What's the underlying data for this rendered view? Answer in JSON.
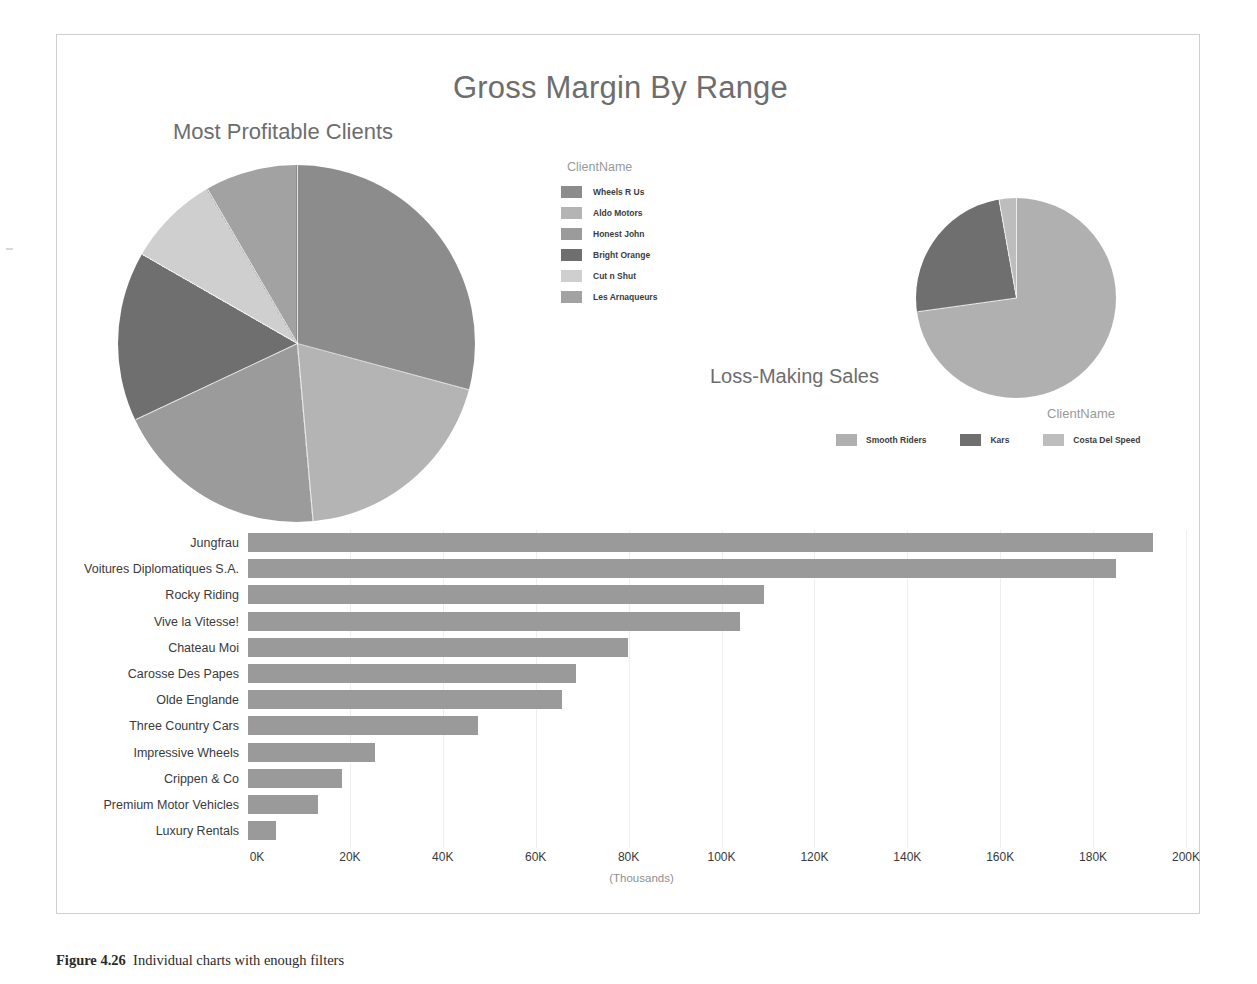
{
  "report": {
    "title": "Gross Margin By Range",
    "caption_number": "Figure 4.26",
    "caption_text": "Individual charts with enough filters"
  },
  "pie1": {
    "title": "Most Profitable Clients",
    "legend_title": "ClientName"
  },
  "pie2": {
    "title": "Loss-Making Sales",
    "legend_title": "ClientName"
  },
  "bar": {
    "axis_units": "(Thousands)"
  },
  "colors": {
    "slice_1": "#8c8c8c",
    "slice_2": "#b4b4b4",
    "slice_3": "#9b9b9b",
    "slice_4": "#6f6f6f",
    "slice_5": "#cfcfcf",
    "slice_6": "#a2a2a2",
    "bar_fill": "#9a9a9a",
    "title_text": "#6d6d6d",
    "legend_title_text": "#9a9a9a",
    "gridline": "#eeeeee",
    "frame_border": "#cfcfcf"
  },
  "chart_data": [
    {
      "type": "pie",
      "title": "Most Profitable Clients",
      "legend_title": "ClientName",
      "legend_position": "right",
      "labels": [
        "Wheels R Us",
        "Aldo Motors",
        "Honest John",
        "Bright Orange",
        "Cut n Shut",
        "Les Arnaqueurs"
      ],
      "percentages": [
        29.2,
        19.4,
        19.4,
        15.3,
        8.3,
        8.4
      ],
      "colors": [
        "#8c8c8c",
        "#b4b4b4",
        "#9b9b9b",
        "#6f6f6f",
        "#cfcfcf",
        "#a2a2a2"
      ]
    },
    {
      "type": "pie",
      "title": "Loss-Making Sales",
      "legend_title": "ClientName",
      "legend_position": "bottom",
      "labels": [
        "Smooth Riders",
        "Kars",
        "Costa Del Speed"
      ],
      "percentages": [
        72.8,
        24.4,
        2.8
      ],
      "colors": [
        "#b0b0b0",
        "#6f6f6f",
        "#bdbdbd"
      ]
    },
    {
      "type": "bar",
      "orientation": "horizontal",
      "title": "",
      "xlabel": "(Thousands)",
      "ylabel": "",
      "xlim": [
        0,
        200
      ],
      "xticks": [
        0,
        20,
        40,
        60,
        80,
        100,
        120,
        140,
        160,
        180,
        200
      ],
      "xtick_labels": [
        "0K",
        "20K",
        "40K",
        "60K",
        "80K",
        "100K",
        "120K",
        "140K",
        "160K",
        "180K",
        "200K"
      ],
      "grid": true,
      "categories": [
        "Jungfrau",
        "Voitures Diplomatiques S.A.",
        "Rocky Riding",
        "Vive la Vitesse!",
        "Chateau Moi",
        "Carosse Des Papes",
        "Olde Englande",
        "Three Country Cars",
        "Impressive Wheels",
        "Crippen & Co",
        "Premium Motor Vehicles",
        "Luxury Rentals"
      ],
      "values": [
        193,
        185,
        110,
        105,
        81,
        70,
        67,
        49,
        27,
        20,
        15,
        6
      ],
      "bar_color": "#9a9a9a"
    }
  ]
}
